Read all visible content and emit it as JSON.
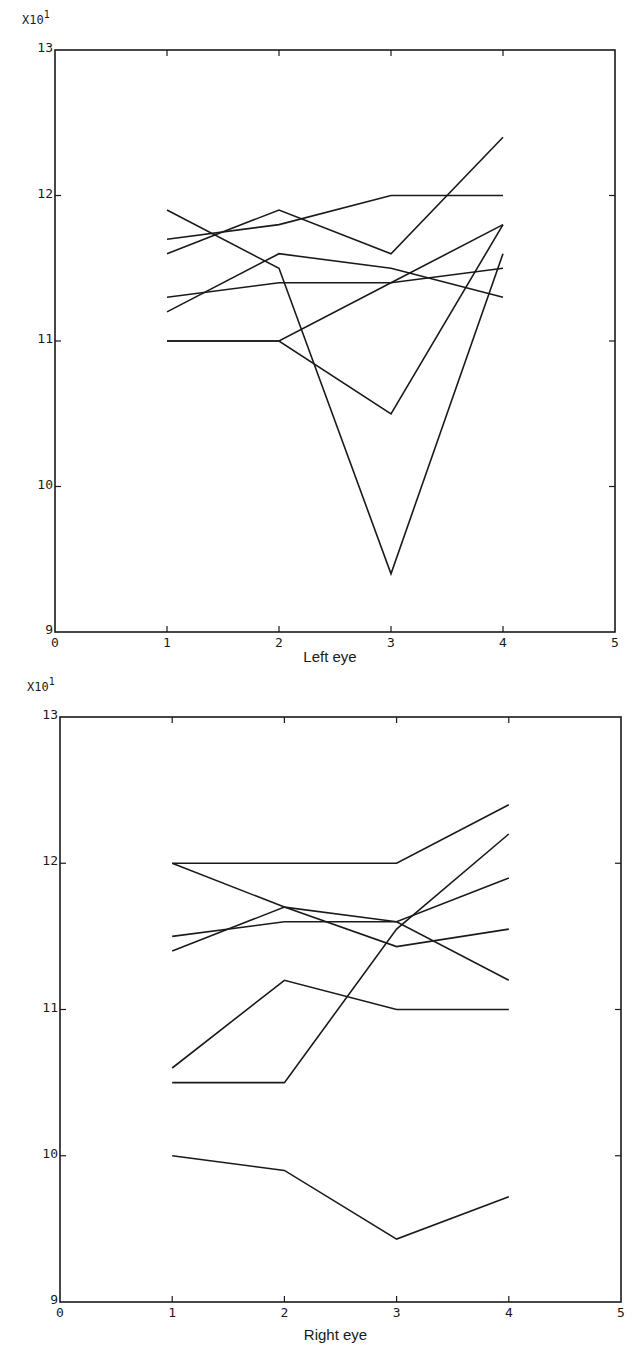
{
  "chart_data": [
    {
      "type": "line",
      "title": "",
      "xlabel": "Left eye",
      "ylabel": "",
      "y_multiplier": "X10",
      "y_multiplier_exp": "1",
      "xlim": [
        0,
        5
      ],
      "ylim": [
        9,
        13
      ],
      "x_ticks": [
        "0",
        "1",
        "2",
        "3",
        "4",
        "5"
      ],
      "y_ticks": [
        "9",
        "10",
        "11",
        "12",
        "13"
      ],
      "grid": false,
      "legend": "none",
      "x": [
        1,
        2,
        3,
        4
      ],
      "series": [
        {
          "name": "subject-1",
          "values": [
            11.9,
            11.5,
            9.4,
            11.6
          ]
        },
        {
          "name": "subject-2",
          "values": [
            11.7,
            11.8,
            12.0,
            12.0
          ]
        },
        {
          "name": "subject-3",
          "values": [
            11.6,
            11.9,
            11.6,
            12.4
          ]
        },
        {
          "name": "subject-4",
          "values": [
            11.2,
            11.6,
            11.5,
            11.3
          ]
        },
        {
          "name": "subject-5",
          "values": [
            11.3,
            11.4,
            11.4,
            11.5
          ]
        },
        {
          "name": "subject-6",
          "values": [
            11.0,
            11.0,
            11.4,
            11.8
          ]
        },
        {
          "name": "subject-7",
          "values": [
            11.0,
            11.0,
            10.5,
            11.8
          ]
        }
      ]
    },
    {
      "type": "line",
      "title": "",
      "xlabel": "Right eye",
      "ylabel": "",
      "y_multiplier": "X10",
      "y_multiplier_exp": "1",
      "xlim": [
        0,
        5
      ],
      "ylim": [
        9,
        13
      ],
      "x_ticks": [
        "0",
        "1",
        "2",
        "3",
        "4",
        "5"
      ],
      "y_ticks": [
        "9",
        "10",
        "11",
        "12",
        "13"
      ],
      "grid": false,
      "legend": "none",
      "x": [
        1,
        2,
        3,
        4
      ],
      "series": [
        {
          "name": "subject-1",
          "values": [
            12.0,
            12.0,
            12.0,
            12.4
          ]
        },
        {
          "name": "subject-2",
          "values": [
            12.0,
            11.7,
            11.43,
            11.55
          ]
        },
        {
          "name": "subject-3",
          "values": [
            11.4,
            11.7,
            11.6,
            11.9
          ]
        },
        {
          "name": "subject-4",
          "values": [
            11.5,
            11.6,
            11.6,
            11.2
          ]
        },
        {
          "name": "subject-5",
          "values": [
            10.5,
            10.5,
            11.55,
            12.2
          ]
        },
        {
          "name": "subject-6",
          "values": [
            10.6,
            11.2,
            11.0,
            11.0
          ]
        },
        {
          "name": "subject-7",
          "values": [
            10.0,
            9.9,
            9.43,
            9.72
          ]
        }
      ]
    }
  ]
}
